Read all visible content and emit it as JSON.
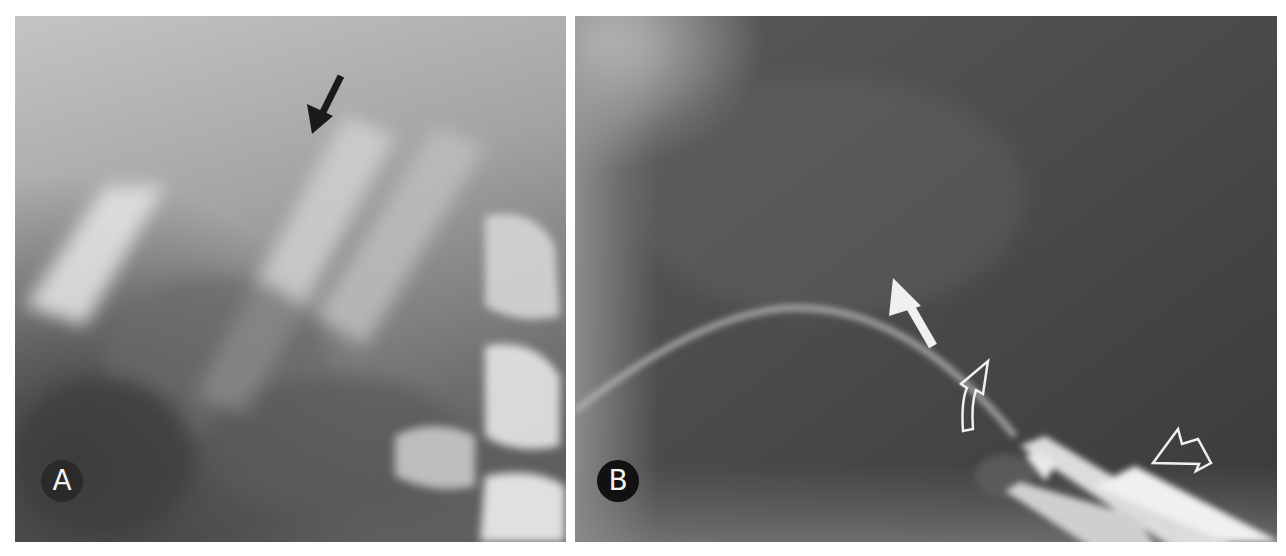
{
  "figure": {
    "background": "#ffffff",
    "panels": [
      {
        "id": "A",
        "label": "A",
        "modality": "radiograph",
        "tone": "light-gray",
        "annotations": [
          {
            "type": "solid-arrow",
            "color": "#1a1a1a",
            "direction": "down-left"
          }
        ]
      },
      {
        "id": "B",
        "label": "B",
        "modality": "radiograph",
        "tone": "dark-gray",
        "annotations": [
          {
            "type": "solid-arrow",
            "color": "#f0f0f0",
            "direction": "up-left"
          },
          {
            "type": "curved-outline-arrow",
            "color": "#f0f0f0",
            "direction": "up"
          },
          {
            "type": "open-arrowhead",
            "color": "#f0f0f0",
            "direction": "down-left"
          }
        ]
      }
    ]
  },
  "colors": {
    "panel_a_base": "#a9a9a9",
    "panel_b_base": "#4a4a4a",
    "annotation_dark": "#1a1a1a",
    "annotation_light": "#f0f0f0"
  }
}
